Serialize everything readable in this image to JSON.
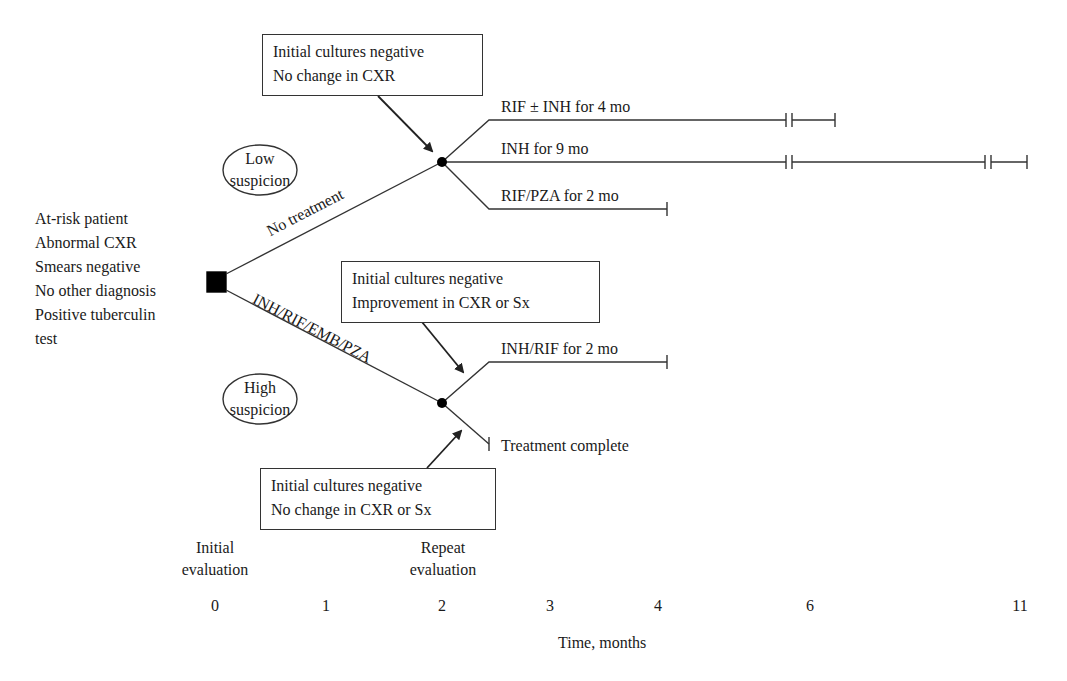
{
  "patient_criteria": [
    "At-risk patient",
    "Abnormal CXR",
    "Smears negative",
    "No other diagnosis",
    "Positive tuberculin",
    "test"
  ],
  "suspicion": {
    "low": [
      "Low",
      "suspicion"
    ],
    "high": [
      "High",
      "suspicion"
    ]
  },
  "branches": {
    "no_treatment": "No treatment",
    "four_drug": "INH/RIF/EMB/PZA"
  },
  "boxes": {
    "top": [
      "Initial cultures negative",
      "No change in CXR"
    ],
    "middle": [
      "Initial cultures negative",
      "Improvement in CXR or Sx"
    ],
    "bottom": [
      "Initial cultures negative",
      "No change in CXR or Sx"
    ]
  },
  "regimens": {
    "rif_inh_4": "RIF ± INH for 4 mo",
    "inh_9": "INH for 9 mo",
    "rif_pza_2": "RIF/PZA for 2 mo",
    "inh_rif_2": "INH/RIF for 2 mo",
    "treatment_complete": "Treatment complete"
  },
  "axis": {
    "evaluations": {
      "initial": [
        "Initial",
        "evaluation"
      ],
      "repeat": [
        "Repeat",
        "evaluation"
      ]
    },
    "ticks": [
      "0",
      "1",
      "2",
      "3",
      "4",
      "6",
      "11"
    ],
    "label": "Time, months"
  },
  "colors": {
    "line": "#333333",
    "text": "#1a1a1a",
    "background": "#ffffff"
  }
}
